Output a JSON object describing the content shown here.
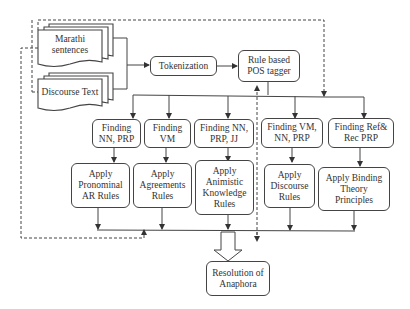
{
  "diagram": {
    "inputs": {
      "marathi": "Marathi sentences",
      "marathi_line1": "Marathi",
      "marathi_line2": "sentences",
      "discourse": "Discourse Text"
    },
    "pipeline": {
      "tokenization": "Tokenization",
      "pos_tagger_line1": "Rule based",
      "pos_tagger_line2": "POS tagger"
    },
    "finding": [
      {
        "line1": "Finding",
        "line2": "NN, PRP"
      },
      {
        "line1": "Finding",
        "line2": "VM"
      },
      {
        "line1": "Finding NN,",
        "line2": "PRP, JJ"
      },
      {
        "line1": "Finding VM,",
        "line2": "NN, PRP"
      },
      {
        "line1": "Finding Ref&",
        "line2": "Rec PRP"
      }
    ],
    "apply": [
      {
        "line1": "Apply",
        "line2": "Pronominal",
        "line3": "AR Rules"
      },
      {
        "line1": "Apply",
        "line2": "Agreements",
        "line3": "Rules"
      },
      {
        "line1": "Apply",
        "line2": "Animistic",
        "line3": "Knowledge",
        "line4": "Rules"
      },
      {
        "line1": "Apply",
        "line2": "Discourse",
        "line3": "Rules"
      },
      {
        "line1": "Apply Binding",
        "line2": "Theory",
        "line3": "Principles"
      }
    ],
    "output": {
      "line1": "Resolution of",
      "line2": "Anaphora"
    },
    "colors": {
      "stroke": "#444444",
      "text": "#333333",
      "background": "#ffffff"
    }
  }
}
